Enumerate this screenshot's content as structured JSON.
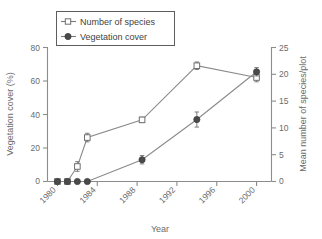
{
  "chart_data": {
    "type": "line",
    "title": "",
    "xlabel": "Year",
    "ylabel": "Vegetation cover (%)",
    "y2label": "Mean number of species/plot",
    "xlim": [
      1979.0,
      2001.5
    ],
    "ylim": [
      0,
      80
    ],
    "y2lim": [
      0,
      25
    ],
    "xticks": [
      1980,
      1984,
      1988,
      1992,
      1996,
      2000
    ],
    "xticklabels": [
      "1980",
      "1984",
      "1988",
      "1992",
      "1996",
      "2000"
    ],
    "yticks": [
      0,
      20,
      40,
      60,
      80
    ],
    "yticklabels": [
      "0",
      "20",
      "40",
      "60",
      "80"
    ],
    "y2ticks": [
      0,
      5,
      10,
      15,
      20,
      25
    ],
    "y2ticklabels": [
      "0",
      "5",
      "10",
      "15",
      "20",
      "25"
    ],
    "grid": false,
    "legend_position": "upper-left",
    "series": [
      {
        "name": "Number of species",
        "axis": "right",
        "marker": "open-square",
        "x": [
          1980.0,
          1981.0,
          1982.0,
          1983.0,
          1988.5,
          1994.0,
          2000.0
        ],
        "values": [
          0.0,
          0.0,
          2.8,
          8.2,
          11.5,
          21.6,
          19.4
        ],
        "errors": [
          0.0,
          0.0,
          0.9,
          0.8,
          0.5,
          0.7,
          0.8
        ]
      },
      {
        "name": "Vegetation cover",
        "axis": "left",
        "marker": "filled-circle",
        "x": [
          1980.0,
          1981.0,
          1982.0,
          1983.0,
          1988.5,
          1994.0,
          2000.0
        ],
        "values": [
          0.0,
          0.0,
          0.0,
          0.0,
          13.0,
          37.0,
          65.5
        ],
        "errors": [
          0.0,
          0.0,
          0.0,
          0.0,
          2.5,
          4.5,
          2.5
        ]
      }
    ]
  },
  "legend": {
    "entries": [
      {
        "label": "Number of species"
      },
      {
        "label": "Vegetation cover"
      }
    ]
  },
  "axes": {
    "x_title": "Year",
    "y_left_title": "Vegetation cover (%)",
    "y_right_title": "Mean number of species/plot"
  }
}
